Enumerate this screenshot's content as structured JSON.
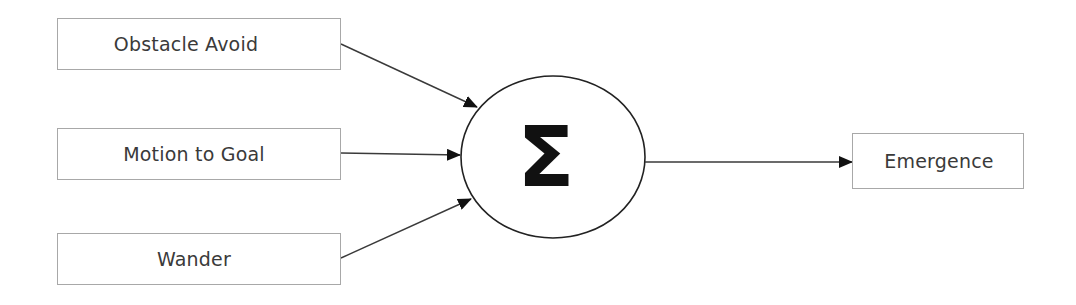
{
  "diagram": {
    "inputs": [
      {
        "id": "obstacle",
        "label": "Obstacle Avoid"
      },
      {
        "id": "motion",
        "label": "Motion to Goal"
      },
      {
        "id": "wander",
        "label": "Wander"
      }
    ],
    "summation": {
      "symbol": "Σ",
      "shape": "ellipse"
    },
    "output": {
      "id": "emergence",
      "label": "Emergence"
    },
    "edges": [
      {
        "from": "Obstacle Avoid",
        "to": "Σ"
      },
      {
        "from": "Motion to Goal",
        "to": "Σ"
      },
      {
        "from": "Wander",
        "to": "Σ"
      },
      {
        "from": "Σ",
        "to": "Emergence"
      }
    ],
    "colors": {
      "box_border": "#a8a8a8",
      "text": "#3a3a3a",
      "line": "#3a3a3a",
      "node_stroke": "#222222"
    }
  }
}
